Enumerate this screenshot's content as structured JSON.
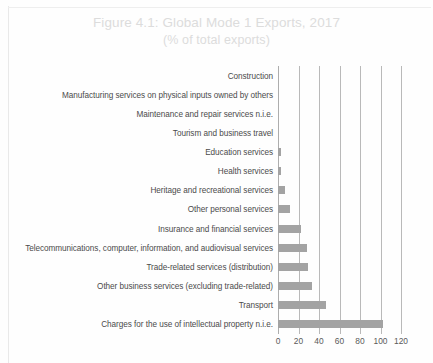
{
  "figure": {
    "title_line1": "Figure 4.1: Global Mode 1 Exports, 2017",
    "title_line2": "(% of total exports)"
  },
  "chart_data": {
    "type": "bar",
    "orientation": "horizontal",
    "title": "Figure 4.1: Global Mode 1 Exports, 2017",
    "subtitle": "(% of total exports)",
    "xlabel": "",
    "ylabel": "",
    "xlim": [
      0,
      120
    ],
    "xticks": [
      0,
      20,
      40,
      60,
      80,
      100,
      120
    ],
    "grid": true,
    "legend": "none",
    "bar_color": "#a3a3a3",
    "categories": [
      "Construction",
      "Manufacturing services on physical inputs owned by others",
      "Maintenance and repair services n.i.e.",
      "Tourism and business travel",
      "Education services",
      "Health services",
      "Heritage and recreational services",
      "Other personal services",
      "Insurance and financial services",
      "Telecommunications, computer, information, and audiovisual services",
      "Trade-related services (distribution)",
      "Other business services (excluding trade-related)",
      "Transport",
      "Charges for the use of intellectual property n.i.e."
    ],
    "values": [
      0,
      0,
      0,
      0,
      3,
      3,
      7,
      12,
      22,
      28,
      29,
      33,
      47,
      102
    ]
  }
}
